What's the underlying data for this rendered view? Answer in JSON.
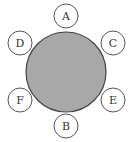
{
  "diagram": {
    "table": {
      "cx": 66,
      "cy": 72,
      "r": 40,
      "fill": "#a8a8a8",
      "stroke": "#444444"
    },
    "seat_radius": 12,
    "seats": [
      {
        "label": "A",
        "cx": 66,
        "cy": 16
      },
      {
        "label": "D",
        "cx": 20,
        "cy": 43
      },
      {
        "label": "C",
        "cx": 113,
        "cy": 43
      },
      {
        "label": "F",
        "cx": 20,
        "cy": 100
      },
      {
        "label": "E",
        "cx": 113,
        "cy": 100
      },
      {
        "label": "B",
        "cx": 66,
        "cy": 126
      }
    ]
  }
}
